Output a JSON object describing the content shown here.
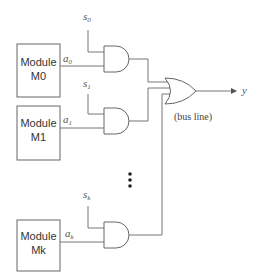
{
  "diagram": {
    "type": "bus multiplexer",
    "modules": [
      {
        "name": "Module",
        "id": "M0",
        "output": "a",
        "output_sub": "0",
        "select": "s",
        "select_sub": "0"
      },
      {
        "name": "Module",
        "id": "M1",
        "output": "a",
        "output_sub": "1",
        "select": "s",
        "select_sub": "1"
      },
      {
        "name": "Module",
        "id": "Mk",
        "output": "a",
        "output_sub": "k",
        "select": "s",
        "select_sub": "k"
      }
    ],
    "ellipsis": "⋮",
    "output_label": "y",
    "bus_label": "(bus line)",
    "gate_types": {
      "select": "AND",
      "combine": "OR"
    }
  }
}
